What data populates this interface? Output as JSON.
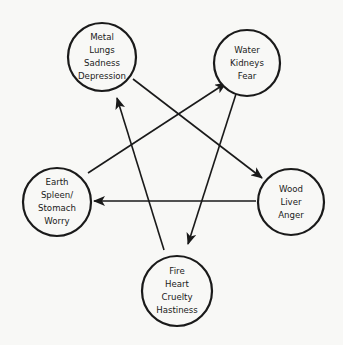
{
  "diagram": {
    "colors": {
      "background": "#f8f8f6",
      "stroke": "#1a1a1a"
    },
    "nodes": [
      {
        "id": "metal",
        "lines": [
          "Metal",
          "Lungs",
          "Sadness",
          "Depression"
        ],
        "cx": 102,
        "cy": 57,
        "r": 34
      },
      {
        "id": "water",
        "lines": [
          "Water",
          "Kidneys",
          "Fear"
        ],
        "cx": 247,
        "cy": 63,
        "r": 33
      },
      {
        "id": "earth",
        "lines": [
          "Earth",
          "Spleen/",
          "Stomach",
          "Worry"
        ],
        "cx": 57,
        "cy": 202,
        "r": 34
      },
      {
        "id": "wood",
        "lines": [
          "Wood",
          "Liver",
          "Anger"
        ],
        "cx": 291,
        "cy": 202,
        "r": 33
      },
      {
        "id": "fire",
        "lines": [
          "Fire",
          "Heart",
          "Cruelty",
          "Hastiness"
        ],
        "cx": 177,
        "cy": 291,
        "r": 35
      }
    ],
    "edges": [
      {
        "from": "metal",
        "to": "wood"
      },
      {
        "from": "water",
        "to": "fire"
      },
      {
        "from": "wood",
        "to": "earth"
      },
      {
        "from": "earth",
        "to": "water"
      },
      {
        "from": "fire",
        "to": "metal"
      }
    ]
  }
}
